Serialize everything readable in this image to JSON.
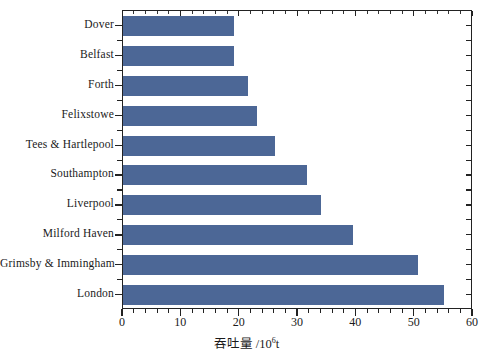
{
  "chart_data": {
    "type": "bar",
    "orientation": "horizontal",
    "title": "",
    "xlabel": "吞吐量 /10⁶t",
    "xlabel_main": "吞吐量",
    "xlabel_units_prefix": "/10",
    "xlabel_units_exp": "6",
    "xlabel_units_suffix": "t",
    "ylabel": "",
    "categories": [
      "Dover",
      "Belfast",
      "Forth",
      "Felixstowe",
      "Tees & Hartlepool",
      "Southampton",
      "Liverpool",
      "Milford Haven",
      "Grimsby & Immingham",
      "London"
    ],
    "values": [
      19,
      19,
      21.5,
      23,
      26,
      31.5,
      34,
      39.5,
      50.5,
      55
    ],
    "xlim": [
      0,
      60
    ],
    "xticks": [
      0,
      10,
      20,
      30,
      40,
      50,
      60
    ],
    "xtick_labels": [
      "0",
      "10",
      "20",
      "30",
      "40",
      "50",
      "60"
    ],
    "x_minor_step": 2,
    "grid": false,
    "legend": false,
    "bar_color": "#4c6796",
    "axis_color": "#222222",
    "background_color": "#ffffff"
  }
}
